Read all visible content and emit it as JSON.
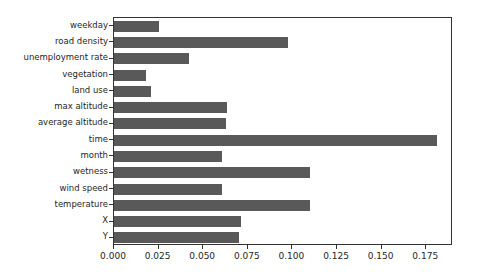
{
  "chart_data": {
    "type": "bar",
    "orientation": "horizontal",
    "title": "",
    "xlabel": "",
    "ylabel": "",
    "xlim": [
      0.0,
      0.19
    ],
    "ylim": [
      0,
      14
    ],
    "grid": false,
    "legend": null,
    "bar_color": "#595959",
    "xticks": [
      0.0,
      0.025,
      0.05,
      0.075,
      0.1,
      0.125,
      0.15,
      0.175
    ],
    "xticklabels": [
      "0.000",
      "0.025",
      "0.050",
      "0.075",
      "0.100",
      "0.125",
      "0.150",
      "0.175"
    ],
    "categories": [
      "weekday",
      "road density",
      "unemployment rate",
      "vegetation",
      "land use",
      "max altitude",
      "average altitude",
      "time",
      "month",
      "wetness",
      "wind speed",
      "temperature",
      "X",
      "Y"
    ],
    "values": [
      0.0255,
      0.0976,
      0.0418,
      0.018,
      0.021,
      0.0635,
      0.063,
      0.181,
      0.0607,
      0.11,
      0.0607,
      0.1098,
      0.0713,
      0.0702
    ]
  }
}
